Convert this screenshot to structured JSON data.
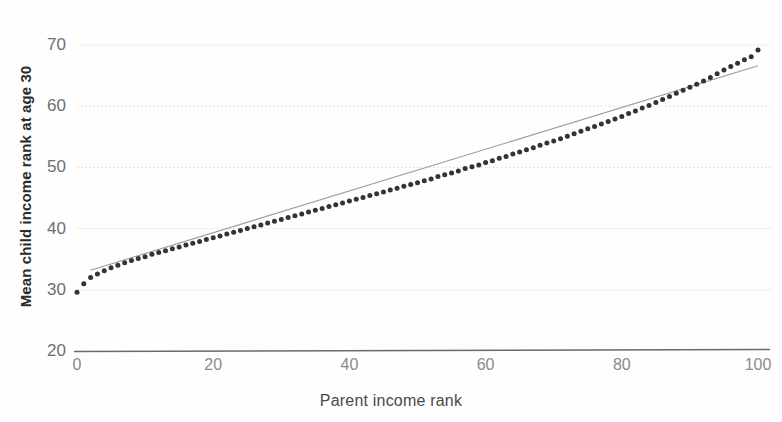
{
  "chart_data": {
    "type": "scatter",
    "title": "",
    "subtitle": "",
    "xlabel": "Parent income rank",
    "ylabel": "Mean child income rank at age 30",
    "xlim": [
      0,
      100
    ],
    "ylim": [
      20,
      74
    ],
    "xticks": [
      0,
      20,
      40,
      60,
      80,
      100
    ],
    "xtick_labels": [
      "0",
      "20",
      "40",
      "60",
      "80",
      "100"
    ],
    "yticks": [
      20,
      30,
      40,
      50,
      60,
      70
    ],
    "ytick_labels": [
      "20",
      "30",
      "40",
      "50",
      "60",
      "70"
    ],
    "grid": "horizontal-dotted-light",
    "legend": "none",
    "marker_color": "#333333",
    "marker_size": 5,
    "trendline": {
      "name": "linear fit",
      "color": "#9a9a9a",
      "x": [
        2,
        100
      ],
      "y": [
        33.2,
        66.6
      ]
    },
    "series": [
      {
        "name": "Mean child income rank at age 30",
        "x": [
          0,
          1,
          2,
          3,
          4,
          5,
          6,
          7,
          8,
          9,
          10,
          11,
          12,
          13,
          14,
          15,
          16,
          17,
          18,
          19,
          20,
          21,
          22,
          23,
          24,
          25,
          26,
          27,
          28,
          29,
          30,
          31,
          32,
          33,
          34,
          35,
          36,
          37,
          38,
          39,
          40,
          41,
          42,
          43,
          44,
          45,
          46,
          47,
          48,
          49,
          50,
          51,
          52,
          53,
          54,
          55,
          56,
          57,
          58,
          59,
          60,
          61,
          62,
          63,
          64,
          65,
          66,
          67,
          68,
          69,
          70,
          71,
          72,
          73,
          74,
          75,
          76,
          77,
          78,
          79,
          80,
          81,
          82,
          83,
          84,
          85,
          86,
          87,
          88,
          89,
          90,
          91,
          92,
          93,
          94,
          95,
          96,
          97,
          98,
          99,
          100
        ],
        "y": [
          29.6,
          31.0,
          32.0,
          32.6,
          33.1,
          33.6,
          34.0,
          34.4,
          34.8,
          35.1,
          35.4,
          35.8,
          36.1,
          36.4,
          36.7,
          37.0,
          37.3,
          37.6,
          37.9,
          38.2,
          38.5,
          38.8,
          39.1,
          39.4,
          39.7,
          40.0,
          40.3,
          40.6,
          40.9,
          41.2,
          41.5,
          41.8,
          42.1,
          42.4,
          42.7,
          43.0,
          43.3,
          43.6,
          43.9,
          44.2,
          44.5,
          44.8,
          45.1,
          45.4,
          45.7,
          46.0,
          46.3,
          46.6,
          46.9,
          47.2,
          47.5,
          47.8,
          48.1,
          48.5,
          48.8,
          49.1,
          49.4,
          49.8,
          50.1,
          50.4,
          50.8,
          51.1,
          51.5,
          51.8,
          52.2,
          52.5,
          52.9,
          53.2,
          53.6,
          54.0,
          54.3,
          54.7,
          55.1,
          55.5,
          55.9,
          56.3,
          56.7,
          57.1,
          57.5,
          57.9,
          58.3,
          58.8,
          59.2,
          59.7,
          60.1,
          60.6,
          61.1,
          61.6,
          62.1,
          62.6,
          63.1,
          63.6,
          64.1,
          64.7,
          65.3,
          65.9,
          66.5,
          67.0,
          67.6,
          68.1,
          69.2
        ]
      }
    ]
  },
  "axes": {
    "y_title": "Mean child income rank at age 30",
    "x_title": "Parent income rank"
  }
}
